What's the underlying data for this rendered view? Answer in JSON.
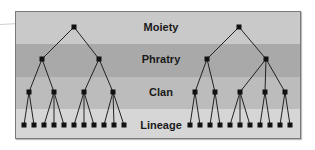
{
  "diagram": {
    "levels": [
      {
        "label": "Moiety",
        "color": "#c9c9c9",
        "top": 0,
        "height": 32,
        "label_y": 16
      },
      {
        "label": "Phratry",
        "color": "#a9a9a9",
        "top": 32,
        "height": 33,
        "label_y": 48
      },
      {
        "label": "Clan",
        "color": "#bcbcbc",
        "top": 65,
        "height": 32,
        "label_y": 81
      },
      {
        "label": "Lineage",
        "color": "#d6d6d6",
        "top": 97,
        "height": 29,
        "label_y": 114
      }
    ],
    "node_color": "#111111",
    "edge_color": "#222222",
    "trees": [
      {
        "name": "left",
        "moiety": {
          "x": 74,
          "y": 27
        },
        "phratries": [
          {
            "x": 42,
            "y": 59,
            "clans": [
              {
                "x": 29,
                "y": 92,
                "lineages": [
                  24,
                  34
                ]
              },
              {
                "x": 54,
                "y": 92,
                "lineages": [
                  44,
                  54,
                  64
                ]
              }
            ]
          },
          {
            "x": 99,
            "y": 59,
            "clans": [
              {
                "x": 84,
                "y": 92,
                "lineages": [
                  74,
                  84,
                  94
                ]
              },
              {
                "x": 113,
                "y": 92,
                "lineages": [
                  104,
                  114,
                  124
                ]
              }
            ]
          }
        ]
      },
      {
        "name": "right",
        "moiety": {
          "x": 239,
          "y": 27
        },
        "phratries": [
          {
            "x": 207,
            "y": 59,
            "clans": [
              {
                "x": 195,
                "y": 92,
                "lineages": [
                  190,
                  200
                ]
              },
              {
                "x": 215,
                "y": 92,
                "lineages": [
                  210,
                  220
                ]
              }
            ]
          },
          {
            "x": 266,
            "y": 59,
            "clans": [
              {
                "x": 240,
                "y": 92,
                "lineages": [
                  230,
                  240,
                  250
                ]
              },
              {
                "x": 265,
                "y": 92,
                "lineages": [
                  260,
                  270
                ]
              },
              {
                "x": 285,
                "y": 92,
                "lineages": [
                  280,
                  290
                ]
              }
            ]
          }
        ]
      }
    ],
    "lineage_y": 125
  }
}
